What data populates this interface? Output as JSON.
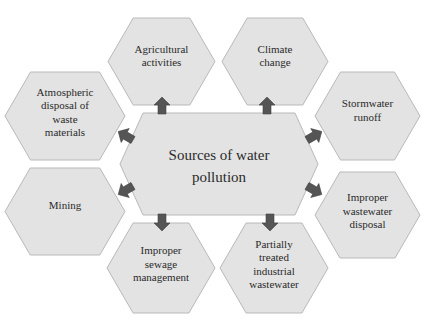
{
  "diagram": {
    "center": {
      "lines": [
        "Sources of water",
        "pollution"
      ]
    },
    "nodes": [
      {
        "id": "agricultural",
        "lines": [
          "Agricultural",
          "activities"
        ]
      },
      {
        "id": "climate",
        "lines": [
          "Climate",
          "change"
        ]
      },
      {
        "id": "atmospheric",
        "lines": [
          "Atmospheric",
          "disposal of",
          "waste",
          "materials"
        ]
      },
      {
        "id": "stormwater",
        "lines": [
          "Stormwater",
          "runoff"
        ]
      },
      {
        "id": "mining",
        "lines": [
          "Mining"
        ]
      },
      {
        "id": "improper-wastewater",
        "lines": [
          "Improper",
          "wastewater",
          "disposal"
        ]
      },
      {
        "id": "improper-sewage",
        "lines": [
          "Improper",
          "sewage",
          "management"
        ]
      },
      {
        "id": "partially-treated",
        "lines": [
          "Partially",
          "treated",
          "industrial",
          "wastewater"
        ]
      }
    ],
    "colors": {
      "hex_fill": "#e3e3e3",
      "hex_stroke": "#b9b9b9",
      "arrow": "#555555",
      "text": "#2a2a2a"
    }
  }
}
